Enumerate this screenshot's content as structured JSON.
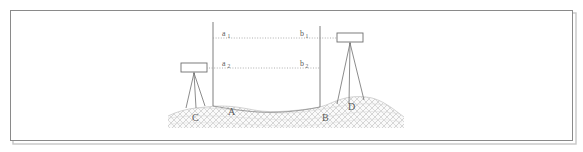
{
  "figure": {
    "frame": {
      "border_color": "#8a8a8a",
      "shadow_color": "#bdbdbd",
      "background": "#ffffff",
      "x": 10,
      "y": 10,
      "width": 563,
      "height": 131
    },
    "colors": {
      "line": "#6f6f6f",
      "dotted": "#9a9a9a",
      "ground_hatch": "#c9c9c9",
      "ground_fill": "#f2f2f2",
      "instrument_stroke": "#6f6f6f",
      "instrument_fill": "#ffffff",
      "label": "#5b5b5b"
    },
    "instruments": [
      {
        "name": "level-left",
        "label": "C",
        "box_x": 181,
        "box_y": 63,
        "box_width": 26,
        "box_height": 9,
        "foot_y": 108,
        "description": "dumpy level on tripod at station C"
      },
      {
        "name": "level-right",
        "label": "D",
        "box_x": 337,
        "box_y": 33,
        "box_width": 26,
        "box_height": 9,
        "foot_y": 104,
        "description": "dumpy level on tripod at station D"
      }
    ],
    "staffs": [
      {
        "name": "staff-left",
        "label": "A",
        "x": 213,
        "top_y": 22,
        "bottom_y": 106
      },
      {
        "name": "staff-right",
        "label": "B",
        "x": 320,
        "top_y": 26,
        "bottom_y": 107
      }
    ],
    "sight_lines": [
      {
        "name": "sight-line-upper",
        "y": 38,
        "x_start": 213,
        "x_end": 350,
        "left_label": "a",
        "left_sub": "1",
        "right_label": "b",
        "right_sub": "1"
      },
      {
        "name": "sight-line-lower",
        "y": 68,
        "x_start": 207,
        "x_end": 320,
        "left_label": "a",
        "left_sub": "2",
        "right_label": "b",
        "right_sub": "2"
      }
    ],
    "point_labels": [
      {
        "name": "point-label-c",
        "text": "C",
        "x": 192,
        "y": 121
      },
      {
        "name": "point-label-a",
        "text": "A",
        "x": 228,
        "y": 115
      },
      {
        "name": "point-label-b",
        "text": "B",
        "x": 322,
        "y": 121
      },
      {
        "name": "point-label-d",
        "text": "D",
        "x": 348,
        "y": 110
      }
    ],
    "reading_labels": [
      {
        "name": "reading-a1",
        "base": "a",
        "sub": "1",
        "x": 222,
        "y": 36
      },
      {
        "name": "reading-b1",
        "base": "b",
        "sub": "1",
        "x": 300,
        "y": 36
      },
      {
        "name": "reading-a2",
        "base": "a",
        "sub": "2",
        "x": 222,
        "y": 66
      },
      {
        "name": "reading-b2",
        "base": "b",
        "sub": "2",
        "x": 300,
        "y": 66
      }
    ]
  }
}
